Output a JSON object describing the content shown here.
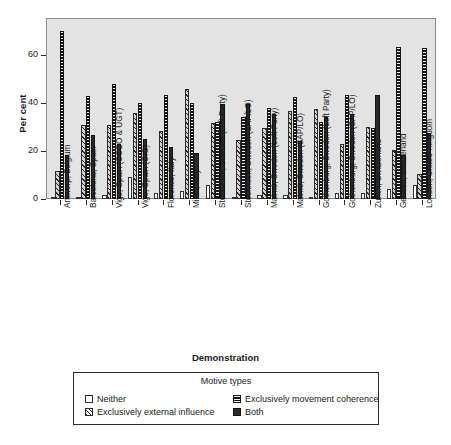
{
  "chart_data": {
    "type": "bar",
    "title": "",
    "xlabel": "Demonstration",
    "ylabel": "Per cent",
    "ylim": [
      0,
      75
    ],
    "yticks": [
      0,
      20,
      40,
      60
    ],
    "ytick_labels": [
      "0",
      "20",
      "40",
      "60"
    ],
    "grid": false,
    "legend_position": "bottom",
    "legend_title": "Motive types",
    "categories": [
      "Antwerp, Belgium",
      "Barcelona, Spain",
      "Vigo, Spain (CCOO & UGT)",
      "Vigo, Spain (CIG)",
      "Florence, Italy",
      "Milan, Italy",
      "Stockholm, Sweden (Left Party)",
      "Stockholm, Sweden (SAP/LO)",
      "Malmö, Sweden (Left Party)",
      "Malmö, Sweden (SAP/LO)",
      "Gothenburg, Sweden (Left Party)",
      "Gothenburg, Sweden (SAP/LO)",
      "Zurich, Switzerland",
      "Geneva, Switzerland",
      "London, United Kingdom"
    ],
    "series": [
      {
        "name": "Neither",
        "key": "neither",
        "values": [
          1,
          1,
          1.5,
          9,
          2.5,
          3.5,
          6,
          1,
          1.5,
          1.5,
          1,
          2.5,
          2.5,
          4,
          6
        ]
      },
      {
        "name": "Exclusively external influence",
        "key": "external",
        "values": [
          11.5,
          31,
          31,
          36,
          28.5,
          46,
          31.5,
          24.5,
          29.5,
          36.5,
          37.5,
          23,
          30,
          20.5,
          10.5
        ]
      },
      {
        "name": "Exclusively movement coherence",
        "key": "coherence",
        "values": [
          70,
          43,
          48,
          40,
          43.5,
          40,
          32,
          34,
          38,
          42.5,
          32,
          43.5,
          29.5,
          63.5,
          63
        ]
      },
      {
        "name": "Both",
        "key": "both",
        "values": [
          18.5,
          26.5,
          23,
          25,
          21.5,
          19,
          39.5,
          39.5,
          35.5,
          24,
          34,
          35.5,
          43.5,
          18.5,
          27.5
        ]
      }
    ]
  },
  "axes": {
    "ylabel": "Per cent",
    "xlabel": "Demonstration"
  },
  "legend": {
    "title": "Motive types",
    "items": [
      {
        "label": "Neither",
        "key": "neither"
      },
      {
        "label": "Exclusively movement coherence",
        "key": "coherence"
      },
      {
        "label": "Exclusively external influence",
        "key": "external"
      },
      {
        "label": "Both",
        "key": "both"
      }
    ]
  }
}
